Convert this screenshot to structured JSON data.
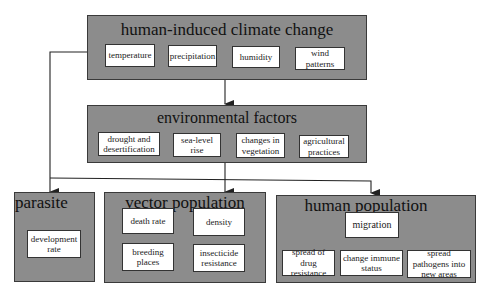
{
  "groups": {
    "climate": {
      "title": "human-induced climate change",
      "items": [
        "temperature",
        "precipitation",
        "humidity",
        "wind patterns"
      ]
    },
    "environment": {
      "title": "environmental factors",
      "items": [
        "drought and desertification",
        "sea-level rise",
        "changes in vegetation",
        "agricultural practices"
      ]
    },
    "parasite": {
      "title": "parasite",
      "items": [
        "development rate"
      ]
    },
    "vector": {
      "title": "vector population",
      "items": [
        "death rate",
        "density",
        "breeding places",
        "insecticide resistance"
      ]
    },
    "human": {
      "title": "human population",
      "hub": "migration",
      "items": [
        "spread of drug resistance",
        "change immune status",
        "spread pathogens into new areas"
      ]
    }
  },
  "colors": {
    "group_fill": "#8c8c8c",
    "item_fill": "#ffffff",
    "line": "#222222"
  }
}
